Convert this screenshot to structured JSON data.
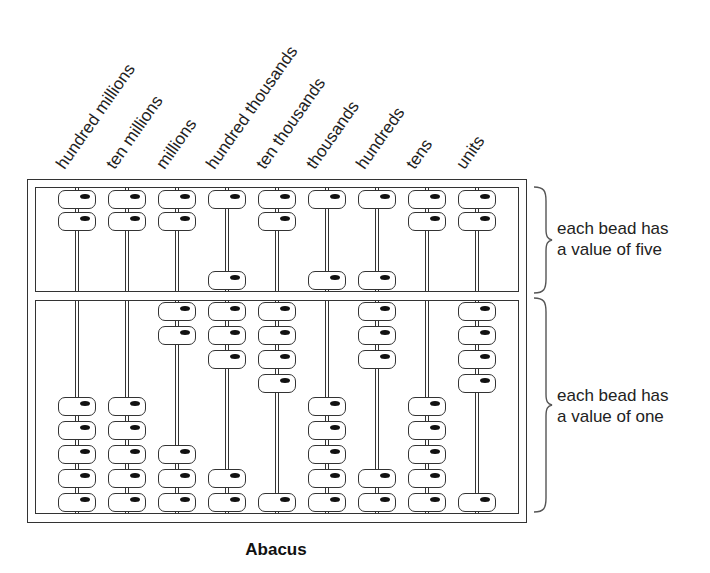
{
  "title": "Abacus",
  "columns": [
    {
      "label": "hundred millions",
      "upper_top": 2,
      "upper_bottom": 0,
      "lower_top": 0,
      "lower_bottom": 5
    },
    {
      "label": "ten millions",
      "upper_top": 2,
      "upper_bottom": 0,
      "lower_top": 0,
      "lower_bottom": 5
    },
    {
      "label": "millions",
      "upper_top": 2,
      "upper_bottom": 0,
      "lower_top": 2,
      "lower_bottom": 3
    },
    {
      "label": "hundred thousands",
      "upper_top": 1,
      "upper_bottom": 1,
      "lower_top": 3,
      "lower_bottom": 2
    },
    {
      "label": "ten thousands",
      "upper_top": 2,
      "upper_bottom": 0,
      "lower_top": 4,
      "lower_bottom": 1
    },
    {
      "label": "thousands",
      "upper_top": 1,
      "upper_bottom": 1,
      "lower_top": 0,
      "lower_bottom": 5
    },
    {
      "label": "hundreds",
      "upper_top": 1,
      "upper_bottom": 1,
      "lower_top": 3,
      "lower_bottom": 2
    },
    {
      "label": "tens",
      "upper_top": 2,
      "upper_bottom": 0,
      "lower_top": 0,
      "lower_bottom": 5
    },
    {
      "label": "units",
      "upper_top": 2,
      "upper_bottom": 0,
      "lower_top": 4,
      "lower_bottom": 1
    }
  ],
  "annotations": {
    "upper": {
      "line1": "each bead has",
      "line2": "a value of five"
    },
    "lower": {
      "line1": "each bead has",
      "line2": "a value of one"
    }
  },
  "colors": {
    "stroke": "#333333",
    "bead_fill": "#ffffff",
    "bead_dot": "#111111",
    "background": "#ffffff"
  }
}
